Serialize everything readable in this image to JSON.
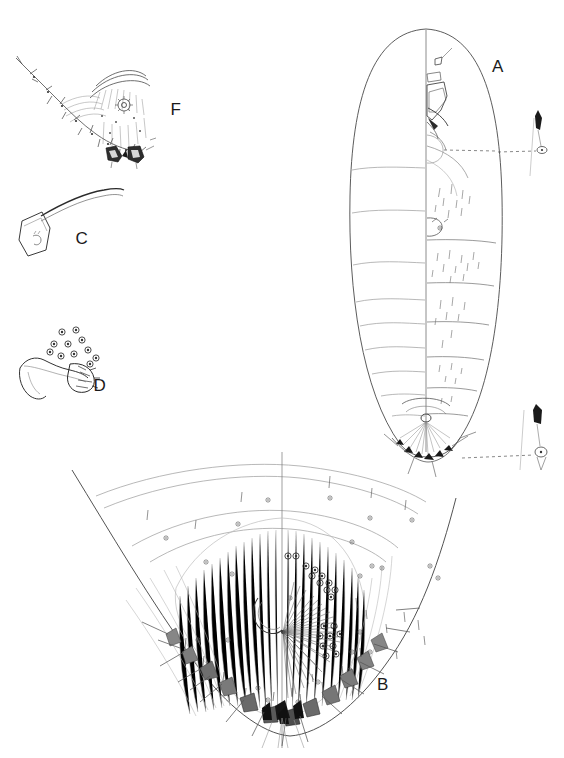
{
  "plate": {
    "kind": "scientific-line-illustration",
    "subject": "whitefly puparium (Aleyrodidae) morphology plate",
    "background_color": "#ffffff",
    "ink_color": "#1a1a1a",
    "width": 564,
    "height": 758,
    "border": "none"
  },
  "labels": [
    {
      "id": "A",
      "text": "A",
      "x": 498,
      "y": 72,
      "description": "whole puparium, dorsal view, left half outline / right half chaetotaxy"
    },
    {
      "id": "B",
      "text": "B",
      "x": 383,
      "y": 690,
      "description": "enlarged posterior abdomen and vasiform orifice region"
    },
    {
      "id": "C",
      "text": "C",
      "x": 82,
      "y": 244,
      "description": "isolated curved seta with basal socket"
    },
    {
      "id": "D",
      "text": "D",
      "x": 100,
      "y": 391,
      "description": "claw-like structure with cluster of ringed pores"
    },
    {
      "id": "F",
      "text": "F",
      "x": 176,
      "y": 115,
      "description": "margin and caudal furrow detail with spiracular comb"
    }
  ],
  "figures": {
    "A": {
      "name": "habitus-dorsal",
      "outline": "elongate-oval puparium",
      "bounds": {
        "x": 350,
        "y": 28,
        "width": 152,
        "height": 440
      },
      "midline": true,
      "segment_lines_left": 8,
      "setae_right": true,
      "leader_lines": 2
    },
    "B": {
      "name": "posterior-abdomen-detail",
      "bounds": {
        "x": 70,
        "y": 455,
        "width": 390,
        "height": 290
      },
      "vasiform_orifice": true,
      "radiating_striations": true,
      "pore_clusters": 2,
      "marginal_teeth": 14
    },
    "C": {
      "name": "seta-detail",
      "bounds": {
        "x": 18,
        "y": 185,
        "width": 110,
        "height": 90
      },
      "socket": "quadrate basal plate",
      "shaft": "long tapering curved"
    },
    "D": {
      "name": "claw-and-pore-cluster",
      "bounds": {
        "x": 18,
        "y": 320,
        "width": 110,
        "height": 80
      },
      "pores": 11
    },
    "F": {
      "name": "margin-detail",
      "bounds": {
        "x": 14,
        "y": 50,
        "width": 155,
        "height": 120
      },
      "comb_teeth": 2,
      "marginal_setae": true
    }
  },
  "callouts": [
    {
      "id": "upper-spine",
      "x": 540,
      "y": 130,
      "type": "dark-tipped-spine-with-pore",
      "leader": "dashed"
    },
    {
      "id": "lower-spine",
      "x": 540,
      "y": 432,
      "type": "dark-tipped-spine-with-pore",
      "leader": "dashed"
    }
  ]
}
